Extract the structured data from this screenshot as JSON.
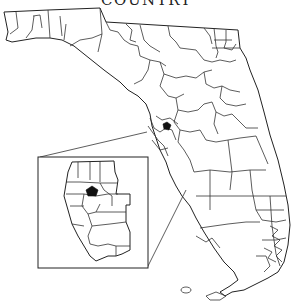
{
  "map": {
    "title": "COUNTRY",
    "region": "Florida",
    "inset": {
      "label": "Tampa Bay area detail",
      "highlight_color": "#111111"
    },
    "colors": {
      "background": "#ffffff",
      "boundary": "#333333",
      "highlight": "#111111"
    }
  }
}
